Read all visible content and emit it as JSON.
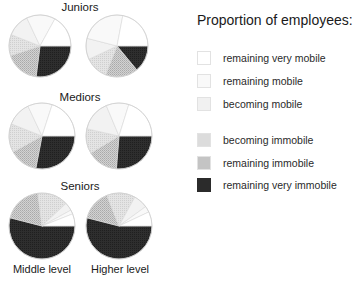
{
  "chart_data": {
    "type": "pie",
    "title": "Proportion of employees:",
    "legend_position": "right",
    "categories": [
      "remaining very mobile",
      "remaining mobile",
      "becoming mobile",
      "becoming immobile",
      "remaining immobile",
      "remaining very immobile"
    ],
    "colors": [
      "#ffffff",
      "#f9f9f9",
      "#f1f1f1",
      "#dcdcdc",
      "#c4c4c4",
      "#2b2b2b"
    ],
    "rows": [
      "Juniors",
      "Mediors",
      "Seniors"
    ],
    "columns": [
      "Middle level",
      "Higher level"
    ],
    "pies": [
      {
        "group": "Juniors",
        "level": "Middle level",
        "values": {
          "remaining very mobile": 17,
          "remaining mobile": 15,
          "becoming mobile": 12,
          "becoming immobile": 11,
          "remaining immobile": 18,
          "remaining very immobile": 27
        }
      },
      {
        "group": "Juniors",
        "level": "Higher level",
        "values": {
          "remaining very mobile": 22,
          "remaining mobile": 24,
          "becoming mobile": 11,
          "becoming immobile": 12,
          "remaining immobile": 17,
          "remaining very immobile": 14
        }
      },
      {
        "group": "Mediors",
        "level": "Middle level",
        "values": {
          "remaining very mobile": 20,
          "remaining mobile": 12,
          "becoming mobile": 12,
          "becoming immobile": 14,
          "remaining immobile": 14,
          "remaining very immobile": 28
        }
      },
      {
        "group": "Mediors",
        "level": "Higher level",
        "values": {
          "remaining very mobile": 20,
          "remaining mobile": 11,
          "becoming mobile": 15,
          "becoming immobile": 12,
          "remaining immobile": 15,
          "remaining very immobile": 26
        }
      },
      {
        "group": "Seniors",
        "level": "Middle level",
        "values": {
          "remaining very mobile": 6,
          "remaining mobile": 2,
          "becoming mobile": 4,
          "becoming immobile": 15,
          "remaining immobile": 19,
          "remaining very immobile": 54
        }
      },
      {
        "group": "Seniors",
        "level": "Higher level",
        "values": {
          "remaining very mobile": 7,
          "remaining mobile": 3,
          "becoming mobile": 7,
          "becoming immobile": 14,
          "remaining immobile": 15,
          "remaining very immobile": 54
        }
      }
    ]
  },
  "groups": {
    "juniors": "Juniors",
    "mediors": "Mediors",
    "seniors": "Seniors"
  },
  "columns": {
    "middle": "Middle level",
    "higher": "Higher level"
  },
  "legend": {
    "title": "Proportion of employees:",
    "items": [
      {
        "label": "remaining very mobile"
      },
      {
        "label": "remaining mobile"
      },
      {
        "label": "becoming mobile"
      },
      {
        "label": "becoming immobile"
      },
      {
        "label": "remaining immobile"
      },
      {
        "label": "remaining very immobile"
      }
    ]
  }
}
